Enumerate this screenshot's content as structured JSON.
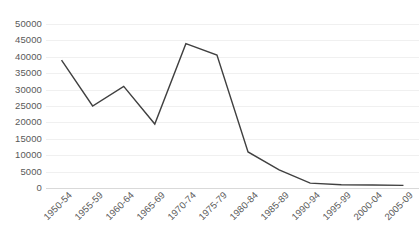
{
  "chart_data": {
    "type": "line",
    "title": "",
    "subtitle": "",
    "xlabel": "",
    "ylabel": "",
    "categories": [
      "1950-54",
      "1955-59",
      "1960-64",
      "1965-69",
      "1970-74",
      "1975-79",
      "1980-84",
      "1985-89",
      "1990-94",
      "1995-99",
      "2000-04",
      "2005-09"
    ],
    "values": [
      39000,
      25000,
      31000,
      19500,
      44000,
      40500,
      11000,
      5500,
      1500,
      1000,
      900,
      800
    ],
    "series": [
      {
        "name": "",
        "values": [
          39000,
          25000,
          31000,
          19500,
          44000,
          40500,
          11000,
          5500,
          1500,
          1000,
          900,
          800
        ]
      }
    ],
    "ylim": [
      0,
      50000
    ],
    "ytick_values": [
      0,
      5000,
      10000,
      15000,
      20000,
      25000,
      30000,
      35000,
      40000,
      45000,
      50000
    ],
    "ytick_labels": [
      "0",
      "5000",
      "10000",
      "15000",
      "20000",
      "25000",
      "30000",
      "35000",
      "40000",
      "45000",
      "50000"
    ],
    "grid": true,
    "grid_axis": "y",
    "legend": false,
    "legend_position": "none",
    "line_color": "#404040",
    "grid_color": "#f0f0f0",
    "axis_color": "#d9d9d9",
    "tick_label_color": "#595959",
    "background_color": "#ffffff",
    "xtick_rotation": -45
  }
}
